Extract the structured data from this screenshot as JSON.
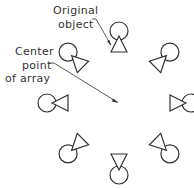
{
  "labels": {
    "original_object": [
      "Original",
      "object"
    ],
    "center_point": [
      "Center",
      "point",
      "of  array"
    ]
  },
  "array": {
    "center": [
      119,
      103
    ],
    "count": 8,
    "angle_step_deg": 45,
    "radius": 72
  },
  "colors": {
    "stroke": "#333333",
    "background": "#ffffff"
  }
}
